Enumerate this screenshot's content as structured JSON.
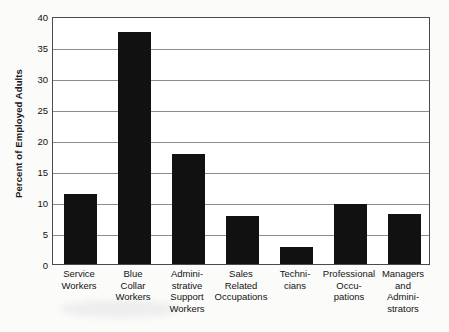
{
  "chart_data": {
    "type": "bar",
    "title": "",
    "xlabel": "",
    "ylabel": "Percent of Employed Adults",
    "ylim": [
      0,
      40
    ],
    "yticks": [
      0,
      5,
      10,
      15,
      20,
      25,
      30,
      35,
      40
    ],
    "ytick_labels": [
      "0",
      "5",
      "10",
      "15",
      "20",
      "25",
      "30",
      "35",
      "40"
    ],
    "grid": true,
    "legend": "none",
    "bar_color": "#111111",
    "categories": [
      "Service Workers",
      "Blue Collar Workers",
      "Administrative Support Workers",
      "Sales Related Occupations",
      "Technicians",
      "Professional Occupations",
      "Managers and Administrators"
    ],
    "category_lines": [
      [
        "Service",
        "Workers"
      ],
      [
        "Blue",
        "Collar",
        "Workers"
      ],
      [
        "Admini-",
        "strative",
        "Support",
        "Workers"
      ],
      [
        "Sales",
        "Related",
        "Occupations"
      ],
      [
        "Techni-",
        "cians"
      ],
      [
        "Professional",
        "Occu-",
        "pations"
      ],
      [
        "Managers",
        "and",
        "Admini-",
        "strators"
      ]
    ],
    "values": [
      11.3,
      37.4,
      17.7,
      7.7,
      2.7,
      9.6,
      8.0
    ]
  },
  "colors": {
    "bar": "#111111",
    "grid": "#8d8d8d",
    "frame": "#4a4a4a",
    "text": "#111111",
    "background": "#fbfbfa"
  }
}
